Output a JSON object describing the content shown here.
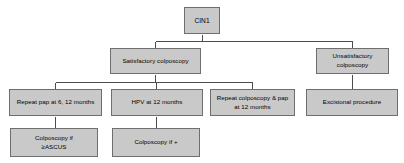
{
  "diagram": {
    "type": "flowchart",
    "style": {
      "node_fill": "#c9c9c9",
      "node_border": "#6e6e6e",
      "edge_color": "#4d4d4d",
      "text_color": "#000000",
      "background": "#ffffff"
    },
    "nodes": [
      {
        "id": "cin1",
        "label": "CIN1",
        "level": 0,
        "x": 184,
        "y": 7,
        "w": 36,
        "h": 27
      },
      {
        "id": "satisfactory",
        "label": "Satisfactory colposcopy",
        "level": 1,
        "x": 110,
        "y": 48,
        "w": 91,
        "h": 26
      },
      {
        "id": "unsatisfactory",
        "label": "Unsatisfactory\ncolposcopy",
        "level": 1,
        "x": 316,
        "y": 48,
        "w": 73,
        "h": 26
      },
      {
        "id": "repeat-pap",
        "label": "Repeat pap at 6, 12 months",
        "level": 2,
        "x": 9,
        "y": 89,
        "w": 93,
        "h": 27
      },
      {
        "id": "hpv",
        "label": "HPV at 12 months",
        "level": 2,
        "x": 111,
        "y": 89,
        "w": 92,
        "h": 27
      },
      {
        "id": "repeat-colpo",
        "label": "Repeat colposcopy & pap\nat 12 months",
        "level": 2,
        "x": 210,
        "y": 89,
        "w": 85,
        "h": 27
      },
      {
        "id": "excisional",
        "label": "Excisional procedure",
        "level": 2,
        "x": 306,
        "y": 89,
        "w": 92,
        "h": 27
      },
      {
        "id": "colpo-ascus",
        "label": "Colposcopy if\n≥ASCUS",
        "level": 3,
        "x": 10,
        "y": 128,
        "w": 88,
        "h": 29
      },
      {
        "id": "colpo-pos",
        "label": "Colposcopy if +",
        "level": 3,
        "x": 112,
        "y": 128,
        "w": 88,
        "h": 29
      }
    ],
    "edges": [
      {
        "from": "cin1",
        "to": "satisfactory"
      },
      {
        "from": "cin1",
        "to": "unsatisfactory"
      },
      {
        "from": "satisfactory",
        "to": "repeat-pap"
      },
      {
        "from": "satisfactory",
        "to": "hpv"
      },
      {
        "from": "satisfactory",
        "to": "repeat-colpo"
      },
      {
        "from": "unsatisfactory",
        "to": "excisional"
      },
      {
        "from": "repeat-pap",
        "to": "colpo-ascus"
      },
      {
        "from": "hpv",
        "to": "colpo-pos"
      }
    ]
  }
}
